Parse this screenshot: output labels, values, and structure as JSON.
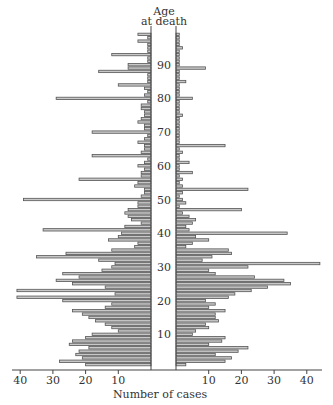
{
  "chart_data": {
    "type": "bar",
    "orientation": "horizontal-back-to-back",
    "title": "",
    "ylabel": "Age at death",
    "ylabel_lines": [
      "Age",
      "at death"
    ],
    "xlabel": "Number of cases",
    "y_ticks": [
      10,
      20,
      30,
      40,
      50,
      60,
      70,
      80,
      90
    ],
    "x_ticks_left": [
      40,
      30,
      20,
      10
    ],
    "x_ticks_right": [
      10,
      20,
      30,
      40
    ],
    "xlim": [
      0,
      45
    ],
    "ylim": [
      0,
      100
    ],
    "grid": false,
    "legend": null,
    "fill_color": "#c8c8c8",
    "stroke_color": "#555555",
    "categories_age": [
      1,
      2,
      3,
      4,
      5,
      6,
      7,
      8,
      9,
      10,
      11,
      12,
      13,
      14,
      15,
      16,
      17,
      18,
      19,
      20,
      21,
      22,
      23,
      24,
      25,
      26,
      27,
      28,
      29,
      30,
      31,
      32,
      33,
      34,
      35,
      36,
      37,
      38,
      39,
      40,
      41,
      42,
      43,
      44,
      45,
      46,
      47,
      48,
      49,
      50,
      51,
      52,
      53,
      54,
      55,
      56,
      57,
      58,
      59,
      60,
      61,
      62,
      63,
      64,
      65,
      66,
      67,
      68,
      69,
      70,
      71,
      72,
      73,
      74,
      75,
      76,
      77,
      78,
      79,
      80,
      81,
      82,
      83,
      84,
      85,
      86,
      87,
      88,
      89,
      90,
      91,
      92,
      93,
      94,
      95,
      96,
      97,
      98,
      99
    ],
    "series": [
      {
        "name": "Left",
        "side": "left",
        "values": [
          20,
          28,
          21,
          23,
          22,
          19,
          25,
          24,
          20,
          18,
          10,
          12,
          14,
          17,
          19,
          21,
          24,
          14,
          12,
          27,
          41,
          11,
          41,
          14,
          24,
          29,
          22,
          27,
          15,
          12,
          11,
          16,
          35,
          26,
          12,
          5,
          4,
          13,
          10,
          9,
          33,
          8,
          3,
          6,
          7,
          8,
          7,
          4,
          4,
          39,
          3,
          2,
          2,
          5,
          4,
          22,
          3,
          3,
          2,
          4,
          2,
          1,
          18,
          3,
          2,
          2,
          4,
          2,
          1,
          18,
          2,
          2,
          4,
          3,
          2,
          2,
          3,
          3,
          1,
          29,
          2,
          1,
          2,
          10,
          1,
          1,
          1,
          16,
          7,
          7,
          1,
          1,
          12,
          1,
          1,
          1,
          4,
          1,
          4
        ]
      },
      {
        "name": "Right",
        "side": "right",
        "values": [
          3,
          15,
          17,
          12,
          19,
          22,
          10,
          14,
          15,
          5,
          6,
          10,
          9,
          13,
          12,
          12,
          15,
          10,
          12,
          9,
          16,
          18,
          23,
          28,
          35,
          33,
          24,
          12,
          10,
          22,
          44,
          8,
          11,
          17,
          16,
          3,
          5,
          10,
          6,
          34,
          4,
          3,
          5,
          6,
          4,
          2,
          20,
          1,
          3,
          2,
          1,
          2,
          22,
          2,
          1,
          2,
          1,
          5,
          1,
          1,
          4,
          1,
          1,
          2,
          1,
          15,
          1,
          1,
          1,
          1,
          1,
          1,
          1,
          1,
          2,
          1,
          1,
          1,
          1,
          5,
          1,
          1,
          1,
          1,
          3,
          1,
          1,
          1,
          9,
          1,
          1,
          1,
          1,
          1,
          2,
          1,
          1,
          1,
          1
        ]
      }
    ]
  },
  "labels": {
    "age_header_line1": "Age",
    "age_header_line2": "at death",
    "x_axis_title": "Number of cases"
  }
}
